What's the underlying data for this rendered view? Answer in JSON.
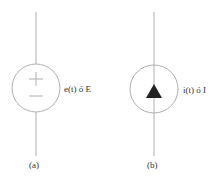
{
  "diagram": {
    "sources": [
      {
        "id": "a",
        "kind": "voltage-source",
        "label": "e(t) ó E",
        "caption": "(a)",
        "plus": "+",
        "minus": "−"
      },
      {
        "id": "b",
        "kind": "current-source",
        "label": "i(t) ó I",
        "caption": "(b)"
      }
    ],
    "colors": {
      "stroke": "#b0b0b0",
      "fill": "#222222",
      "text": "#333333"
    }
  }
}
